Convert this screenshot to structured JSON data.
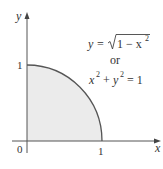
{
  "diagram": {
    "axes": {
      "x_label": "x",
      "y_label": "y",
      "origin_label": "0",
      "x_tick_label": "1",
      "y_tick_label": "1"
    },
    "equations": {
      "line1_lhs": "y = ",
      "line1_root_content": "1 − x",
      "line1_exp": "2",
      "line2": "or",
      "line3_x": "x",
      "line3_exp1": "2",
      "line3_plus": " + ",
      "line3_y": "y",
      "line3_exp2": "2",
      "line3_rhs": " = 1"
    },
    "region": {
      "description": "quarter unit disk in first quadrant",
      "fill_color": "#ebebeb",
      "curve_color": "#555555"
    }
  }
}
